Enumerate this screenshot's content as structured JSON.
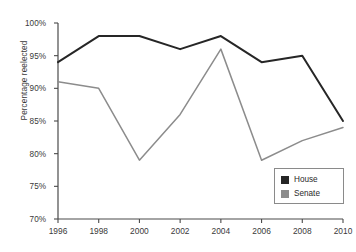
{
  "chart_data": {
    "type": "line",
    "title": "",
    "xlabel": "",
    "ylabel": "Percentage reelected",
    "categories": [
      1996,
      1998,
      2000,
      2002,
      2004,
      2006,
      2008,
      2010
    ],
    "x_tick_labels": [
      "1996",
      "1998",
      "2000",
      "2002",
      "2004",
      "2006",
      "2008",
      "2010"
    ],
    "y_tick_labels": [
      "100%",
      "95%",
      "90%",
      "85%",
      "80%",
      "75%",
      "70%"
    ],
    "y_tick_values": [
      100,
      95,
      90,
      85,
      80,
      75,
      70
    ],
    "ylim": [
      70,
      100
    ],
    "xlim": [
      1996,
      2010
    ],
    "grid": false,
    "legend_position": "bottom-right",
    "series": [
      {
        "name": "House",
        "color": "#262626",
        "values": [
          94,
          98,
          98,
          96,
          98,
          94,
          95,
          85
        ]
      },
      {
        "name": "Senate",
        "color": "#8c8c8c",
        "values": [
          91,
          90,
          79,
          86,
          96,
          79,
          82,
          84
        ]
      }
    ]
  },
  "legend": {
    "items": [
      {
        "label": "House",
        "color": "#262626"
      },
      {
        "label": "Senate",
        "color": "#8c8c8c"
      }
    ]
  },
  "axis_colors": {
    "axis_line": "#4a4a4a",
    "tick_text": "#3a3a3a"
  }
}
